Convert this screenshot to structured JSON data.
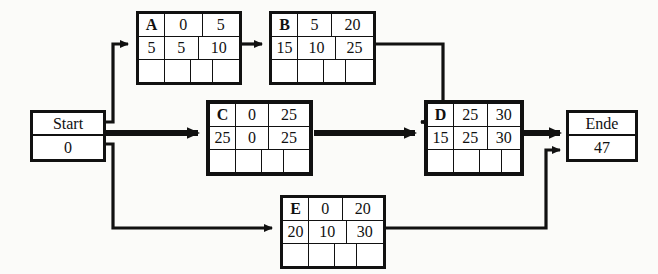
{
  "diagram": {
    "colors": {
      "ink": "#111111",
      "paper": "#fbfbf9"
    },
    "start": {
      "label": "Start",
      "value": "0"
    },
    "end": {
      "label": "Ende",
      "value": "47"
    },
    "nodes": [
      {
        "id": "A",
        "name": "A",
        "top_mid": "0",
        "top_right": "5",
        "mid_left": "5",
        "mid_mid": "5",
        "mid_right": "10",
        "bottom": [
          "",
          "",
          "",
          ""
        ]
      },
      {
        "id": "B",
        "name": "B",
        "top_mid": "5",
        "top_right": "20",
        "mid_left": "15",
        "mid_mid": "10",
        "mid_right": "25",
        "bottom": [
          "",
          "",
          "",
          ""
        ]
      },
      {
        "id": "C",
        "name": "C",
        "top_mid": "0",
        "top_right": "25",
        "mid_left": "25",
        "mid_mid": "0",
        "mid_right": "25",
        "bottom": [
          "",
          "",
          "",
          ""
        ]
      },
      {
        "id": "D",
        "name": "D",
        "top_mid": "25",
        "top_right": "30",
        "mid_left": "15",
        "mid_mid": "25",
        "mid_right": "30",
        "bottom": [
          "",
          "",
          "",
          ""
        ]
      },
      {
        "id": "E",
        "name": "E",
        "top_mid": "0",
        "top_right": "20",
        "mid_left": "20",
        "mid_mid": "10",
        "mid_right": "30",
        "bottom": [
          "",
          "",
          "",
          ""
        ]
      }
    ],
    "edges": [
      {
        "from": "Start",
        "to": "A",
        "emphasis": "normal"
      },
      {
        "from": "A",
        "to": "B",
        "emphasis": "normal"
      },
      {
        "from": "B",
        "to": "D",
        "emphasis": "normal"
      },
      {
        "from": "Start",
        "to": "C",
        "emphasis": "critical"
      },
      {
        "from": "C",
        "to": "D",
        "emphasis": "critical"
      },
      {
        "from": "D",
        "to": "Ende",
        "emphasis": "critical"
      },
      {
        "from": "Start",
        "to": "E",
        "emphasis": "normal"
      },
      {
        "from": "E",
        "to": "Ende",
        "emphasis": "normal"
      }
    ]
  }
}
